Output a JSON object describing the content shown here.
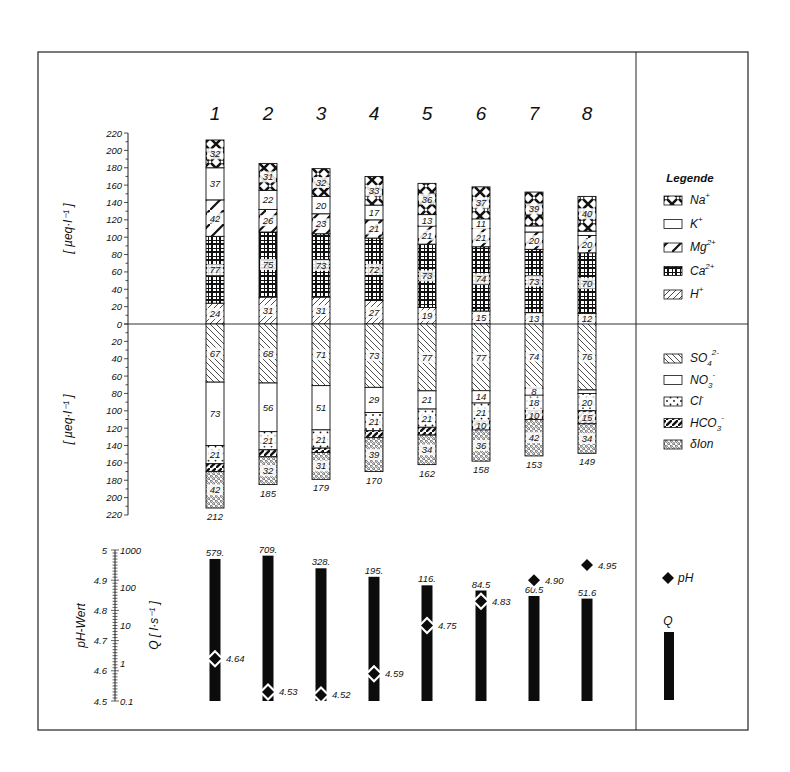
{
  "chart_data": {
    "type": "bar",
    "subtype": "stacked-bar-ion-balance-with-ph-and-discharge",
    "categories": [
      "1",
      "2",
      "3",
      "4",
      "5",
      "6",
      "7",
      "8"
    ],
    "cations": {
      "ylabel": "[ µeq·l⁻¹ ]",
      "ylim": [
        0,
        220
      ],
      "yticks": [
        0,
        20,
        40,
        60,
        80,
        100,
        120,
        140,
        160,
        180,
        200,
        220
      ],
      "series": [
        {
          "name": "H+",
          "key": "H",
          "values": [
            24,
            31,
            31,
            27,
            19,
            15,
            13,
            12
          ]
        },
        {
          "name": "Ca2+",
          "key": "Ca",
          "values": [
            77,
            75,
            73,
            72,
            73,
            74,
            73,
            70
          ]
        },
        {
          "name": "Mg2+",
          "key": "Mg",
          "values": [
            42,
            26,
            23,
            21,
            21,
            21,
            20,
            20
          ]
        },
        {
          "name": "K+",
          "key": "K",
          "values": [
            37,
            22,
            20,
            17,
            13,
            11,
            7,
            5
          ]
        },
        {
          "name": "Na+",
          "key": "Na",
          "values": [
            32,
            31,
            32,
            33,
            36,
            37,
            39,
            40
          ]
        }
      ],
      "labels_shown": {
        "H": [
          "24",
          "31",
          "31",
          "27",
          "19",
          "15",
          "13",
          "12"
        ],
        "Ca": [
          "77",
          "75",
          "73",
          "72",
          "73",
          "74",
          "73",
          "70"
        ],
        "Mg": [
          "42",
          "26",
          "23",
          "21",
          "21",
          "21",
          "20",
          "20"
        ],
        "K": [
          "37",
          "22",
          "20",
          "17",
          "13",
          "11",
          "",
          ""
        ],
        "Na": [
          "32",
          "31",
          "32",
          "33",
          "36",
          "37",
          "39",
          "40"
        ]
      }
    },
    "anions": {
      "ylabel": "[ µeq·l⁻¹ ]",
      "ylim": [
        0,
        220
      ],
      "yticks": [
        0,
        20,
        40,
        60,
        80,
        100,
        120,
        140,
        160,
        180,
        200,
        220
      ],
      "series": [
        {
          "name": "SO4 2-",
          "key": "SO4",
          "values": [
            67,
            68,
            71,
            73,
            77,
            77,
            74,
            76
          ]
        },
        {
          "name": "NO3 -",
          "key": "NO3",
          "values": [
            73,
            56,
            51,
            29,
            21,
            14,
            8,
            4
          ]
        },
        {
          "name": "Cl -",
          "key": "Cl",
          "values": [
            21,
            21,
            21,
            21,
            21,
            21,
            18,
            20
          ]
        },
        {
          "name": "HCO3 -",
          "key": "HCO3",
          "values": [
            9,
            8,
            5,
            8,
            9,
            10,
            10,
            15
          ]
        },
        {
          "name": "δIon",
          "key": "dIon",
          "values": [
            42,
            32,
            31,
            39,
            34,
            36,
            42,
            34
          ]
        }
      ],
      "labels_shown": {
        "SO4": [
          "67",
          "68",
          "71",
          "73",
          "77",
          "77",
          "74",
          "76"
        ],
        "NO3": [
          "73",
          "56",
          "51",
          "29",
          "21",
          "14",
          "8",
          ""
        ],
        "Cl": [
          "21",
          "21",
          "21",
          "21",
          "21",
          "21",
          "18",
          "20"
        ],
        "HCO3": [
          "",
          "",
          "",
          "",
          "",
          "10",
          "10",
          "15"
        ],
        "dIon": [
          "42",
          "32",
          "31",
          "39",
          "34",
          "36",
          "42",
          "34"
        ]
      },
      "totals": [
        "212",
        "185",
        "179",
        "170",
        "162",
        "158",
        "153",
        "149"
      ]
    },
    "ph_discharge": {
      "ph_label": "pH-Wert",
      "q_label": "Q [ l·s⁻¹ ]",
      "ph_ylim": [
        4.5,
        5.0
      ],
      "ph_ticks": [
        "5",
        "4.9",
        "4.8",
        "4.7",
        "4.6",
        "4.5"
      ],
      "q_ticks": [
        "1000",
        "100",
        "10",
        "1",
        "0.1"
      ],
      "q_scale": "log",
      "Q": [
        579,
        709,
        328,
        195,
        116,
        84.5,
        60.5,
        51.6
      ],
      "Q_labels": [
        "579.",
        "709.",
        "328.",
        "195.",
        "116.",
        "84.5",
        "60.5",
        "51.6"
      ],
      "pH": [
        4.64,
        4.53,
        4.52,
        4.59,
        4.75,
        4.83,
        4.9,
        4.95
      ],
      "pH_labels": [
        "4.64",
        "4.53",
        "4.52",
        "4.59",
        "4.75",
        "4.83",
        "4.90",
        "4.95"
      ]
    },
    "legend": {
      "title": "Legende",
      "cations": [
        {
          "key": "Na",
          "label": "Na",
          "sup": "+"
        },
        {
          "key": "K",
          "label": "K",
          "sup": "+"
        },
        {
          "key": "Mg",
          "label": "Mg",
          "sup": "2+"
        },
        {
          "key": "Ca",
          "label": "Ca",
          "sup": "2+"
        },
        {
          "key": "H",
          "label": "H",
          "sup": "+"
        }
      ],
      "anions": [
        {
          "key": "SO4",
          "label": "SO",
          "sub": "4",
          "sup": "2-"
        },
        {
          "key": "NO3",
          "label": "NO",
          "sub": "3",
          "sup": "-"
        },
        {
          "key": "Cl",
          "label": "Cl",
          "sup": "-"
        },
        {
          "key": "HCO3",
          "label": "HCO",
          "sub": "3",
          "sup": "-"
        },
        {
          "key": "dIon",
          "label": "δIon"
        }
      ],
      "ph": {
        "label": "pH"
      },
      "q": {
        "label": "Q"
      }
    },
    "grid": false,
    "legend_position": "right"
  }
}
